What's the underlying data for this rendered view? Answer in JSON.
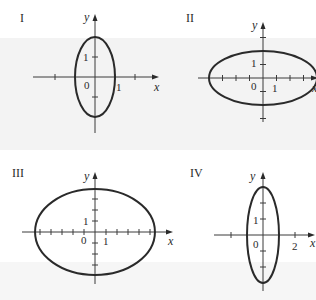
{
  "figure": {
    "panels": [
      {
        "id": "I",
        "label": "I",
        "label_pos": [
          20,
          22
        ],
        "origin": [
          95,
          77
        ],
        "unit_px": 20,
        "x_axis": {
          "from": 33,
          "to": 159
        },
        "y_axis": {
          "from": 133,
          "to": 14
        },
        "x_ticks": [
          -2,
          1,
          2
        ],
        "y_ticks": [
          1,
          -1
        ],
        "ellipse": {
          "a": 1,
          "b": 2
        },
        "labels": {
          "x": "x",
          "y": "y",
          "origin": "0",
          "x_tick_label": "1",
          "y_tick_label": "1"
        },
        "label_positions": {
          "x": [
            154,
            91
          ],
          "y": [
            84,
            21
          ],
          "origin": [
            84,
            89
          ],
          "x_tick_label": [
            116,
            91
          ],
          "y_tick_label": [
            83,
            61
          ]
        }
      },
      {
        "id": "II",
        "label": "II",
        "label_pos": [
          186,
          22
        ],
        "origin": [
          263,
          78
        ],
        "unit_px": 13.5,
        "x_axis": {
          "from": 198,
          "to": 318
        },
        "y_axis": {
          "from": 122,
          "to": 22
        },
        "x_ticks": [
          -3,
          -2,
          -1,
          1,
          2,
          3
        ],
        "y_ticks": [
          3,
          1,
          -1,
          -3
        ],
        "ellipse": {
          "a": 4,
          "b": 2
        },
        "labels": {
          "x": "x",
          "y": "y",
          "origin": "0",
          "x_tick_label": "1",
          "y_tick_label": "1"
        },
        "label_positions": {
          "x": [
            312,
            92
          ],
          "y": [
            252,
            29
          ],
          "origin": [
            251,
            90
          ],
          "x_tick_label": [
            272,
            92
          ],
          "y_tick_label": [
            251,
            67
          ]
        }
      },
      {
        "id": "III",
        "label": "III",
        "label_pos": [
          12,
          177
        ],
        "origin": [
          95,
          232
        ],
        "unit_px": 11,
        "x_axis": {
          "from": 22,
          "to": 173
        },
        "y_axis": {
          "from": 284,
          "to": 172
        },
        "x_ticks": [
          -5,
          -4,
          -3,
          -2,
          -1,
          1,
          2,
          3,
          4,
          5
        ],
        "y_ticks": [
          1,
          2,
          3,
          -1,
          -2,
          -3
        ],
        "ellipse": {
          "a": 5.45,
          "b": 3.9
        },
        "labels": {
          "x": "x",
          "y": "y",
          "origin": "0",
          "x_tick_label": "1",
          "y_tick_label": "1"
        },
        "label_positions": {
          "x": [
            168,
            245
          ],
          "y": [
            84,
            180
          ],
          "origin": [
            81,
            244
          ],
          "x_tick_label": [
            103,
            245
          ],
          "y_tick_label": [
            83,
            225
          ]
        }
      },
      {
        "id": "IV",
        "label": "IV",
        "label_pos": [
          190,
          177
        ],
        "origin": [
          263,
          235
        ],
        "unit_px": 16,
        "x_axis": {
          "from": 214,
          "to": 315
        },
        "y_axis": {
          "from": 291,
          "to": 172
        },
        "x_ticks": [
          -2,
          2
        ],
        "y_ticks": [
          2,
          1,
          -1,
          -2
        ],
        "ellipse": {
          "a": 1,
          "b": 3
        },
        "labels": {
          "x": "x",
          "y": "y",
          "origin": "0",
          "x_tick_label": "2",
          "y_tick_label": "1"
        },
        "label_positions": {
          "x": [
            310,
            247
          ],
          "y": [
            250,
            180
          ],
          "origin": [
            253,
            248
          ],
          "x_tick_label": [
            292,
            250
          ],
          "y_tick_label": [
            253,
            224
          ]
        }
      }
    ]
  }
}
